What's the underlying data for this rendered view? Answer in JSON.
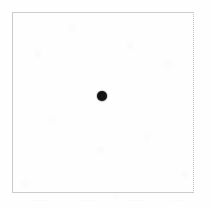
{
  "figure": {
    "title": "",
    "width": 210,
    "height": 208,
    "background_color": "#fefefe",
    "border_color": "#cacaca",
    "dot_color": "#131313",
    "caption": ""
  },
  "chart_data": {
    "type": "scatter",
    "title": "",
    "subtitle": "",
    "xlabel": "",
    "ylabel": "",
    "grid": false,
    "legend": null,
    "legend_position": "none",
    "tick_labels_x": [],
    "tick_labels_y": [],
    "annotations": [],
    "plot_frame": {
      "left_px": 12,
      "top_px": 12,
      "right_px": 194,
      "bottom_px": 193,
      "width_px": 182,
      "height_px": 181,
      "border_style": "thin-rectangle"
    },
    "xlim": [
      0,
      1
    ],
    "ylim": [
      0,
      1
    ],
    "series": [
      {
        "name": "point",
        "marker": "filled-circle",
        "marker_color": "#131313",
        "marker_diameter_px": 10,
        "points": [
          {
            "x": 0.5,
            "y": 0.54,
            "px_x": 102,
            "px_y": 96,
            "label": ""
          }
        ]
      }
    ]
  },
  "elements": {
    "frame_name": "plot frame",
    "dot_name": "data point",
    "paper_name": "scanned paper background"
  }
}
